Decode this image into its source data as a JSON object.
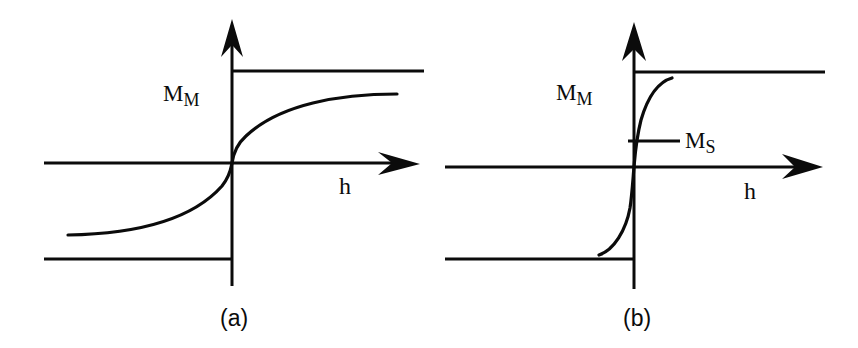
{
  "figure": {
    "panels": [
      {
        "id": "a",
        "caption": "(a)",
        "y_level_label": "M",
        "y_level_label_sub": "M",
        "x_axis_label": "h",
        "description": "Gradual S-shaped magnetization curve approaching saturation level ±M_M"
      },
      {
        "id": "b",
        "caption": "(b)",
        "y_level_label": "M",
        "y_level_label_sub": "M",
        "x_axis_label": "h",
        "ms_label": "M",
        "ms_label_sub": "S",
        "description": "Steep magnetization curve with spontaneous magnetization M_S marked on vertical axis, approaching ±M_M"
      }
    ],
    "colors": {
      "ink": "#0b0b0b",
      "background": "#ffffff"
    }
  }
}
